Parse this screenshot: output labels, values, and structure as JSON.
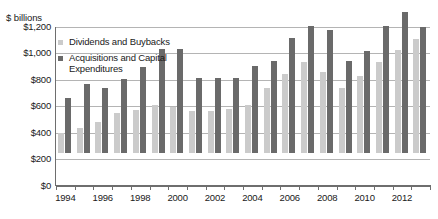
{
  "chart_data": {
    "type": "bar",
    "title": "",
    "subtitle": "",
    "unit_label": "$ billions",
    "xlabel": "",
    "ylabel": "$ billions",
    "ylim": [
      0,
      1200
    ],
    "ytick_values": [
      0,
      200,
      400,
      600,
      800,
      1000,
      1200
    ],
    "ytick_labels": [
      "$0",
      "$200",
      "$400",
      "$600",
      "$800",
      "$1,000",
      "$1,200"
    ],
    "grid": true,
    "legend_position": "upper-left-inside",
    "categories": [
      "1994",
      "1995",
      "1996",
      "1997",
      "1998",
      "1999",
      "2000",
      "2001",
      "2002",
      "2003",
      "2004",
      "2005",
      "2006",
      "2007",
      "2008",
      "2009",
      "2010",
      "2011",
      "2012",
      "2013"
    ],
    "xtick_labels_shown": [
      "1994",
      "1996",
      "1998",
      "2000",
      "2002",
      "2004",
      "2006",
      "2008",
      "2010",
      "2012"
    ],
    "series": [
      {
        "name": "Dividends and Buybacks",
        "color": "#cbcbcb",
        "values": [
          155,
          190,
          235,
          300,
          325,
          360,
          345,
          320,
          315,
          330,
          360,
          490,
          600,
          690,
          615,
          490,
          585,
          690,
          780,
          860
        ]
      },
      {
        "name": "Acquisitions and Capital Expenditures",
        "color": "#6a6a6a",
        "values": [
          415,
          525,
          495,
          560,
          650,
          790,
          790,
          565,
          570,
          570,
          660,
          700,
          870,
          960,
          935,
          700,
          775,
          960,
          1065,
          955
        ]
      }
    ]
  },
  "legend": {
    "entries": [
      {
        "label": "Dividends and Buybacks",
        "color": "#cbcbcb"
      },
      {
        "label": "Acquisitions and Capital\nExpenditures",
        "color": "#6a6a6a"
      }
    ]
  },
  "colors": {
    "dividends": "#cbcbcb",
    "acquisitions": "#6a6a6a",
    "gridline": "#b4b4b4",
    "axis": "#6e6e6e",
    "text": "#1a1a1a",
    "background": "#ffffff"
  }
}
